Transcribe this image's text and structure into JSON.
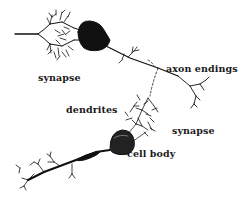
{
  "diagram": {
    "labels": {
      "synapse_top": "synapse",
      "axon_endings": "axon endings",
      "dendrites": "dendrites",
      "synapse_bottom": "synapse",
      "cell_body": "cell body"
    },
    "colors": {
      "ink": "#111111",
      "background": "#ffffff"
    }
  }
}
